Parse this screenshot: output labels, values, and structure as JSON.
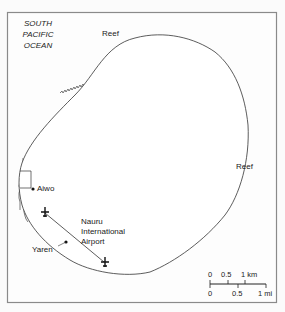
{
  "map": {
    "ocean_label": [
      "SOUTH",
      "PACIFIC",
      "OCEAN"
    ],
    "reef_labels": [
      "Reef",
      "Reef"
    ],
    "places": {
      "aiwo": "Aiwo",
      "yaren": "Yaren",
      "airport": [
        "Nauru",
        "International",
        "Airport"
      ]
    },
    "scale": {
      "km_ticks": [
        "0",
        "0.5",
        "1 km"
      ],
      "mi_ticks": [
        "0",
        "0.5",
        "1 mi"
      ]
    },
    "colors": {
      "background": "#fbfbfb",
      "frame": "#8a8a8a",
      "line": "#333333"
    }
  }
}
